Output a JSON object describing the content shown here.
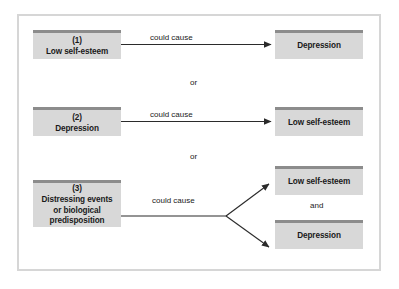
{
  "figure": {
    "type": "flow-diagram",
    "title_text": "",
    "colors": {
      "box_fill": "#d8d8d8",
      "box_top_stripe": "#8c8c8c",
      "frame_border": "#d6d6d6",
      "arrow": "#2b2b2b",
      "text": "#1a1a1a",
      "background": "#ffffff"
    },
    "rows": [
      {
        "id": "row-1",
        "cause": {
          "index": "(1)",
          "lines": [
            "Low self-esteem"
          ]
        },
        "connector": "could cause",
        "effects": [
          {
            "lines": [
              "Depression"
            ]
          }
        ],
        "effect_operator": ""
      },
      {
        "id": "row-2",
        "cause": {
          "index": "(2)",
          "lines": [
            "Depression"
          ]
        },
        "connector": "could cause",
        "effects": [
          {
            "lines": [
              "Low self-esteem"
            ]
          }
        ],
        "effect_operator": ""
      },
      {
        "id": "row-3",
        "cause": {
          "index": "(3)",
          "lines": [
            "Distressing events",
            "or biological",
            "predisposition"
          ]
        },
        "connector": "could cause",
        "effects": [
          {
            "lines": [
              "Low self-esteem"
            ]
          },
          {
            "lines": [
              "Depression"
            ]
          }
        ],
        "effect_operator": "and"
      }
    ],
    "row_separators": [
      "or",
      "or"
    ]
  }
}
